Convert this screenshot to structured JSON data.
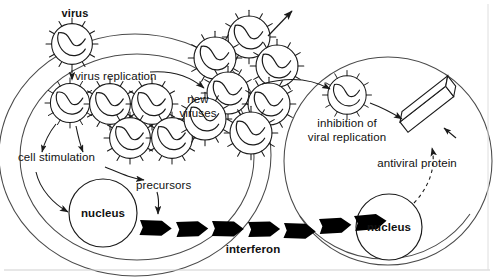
{
  "diagram": {
    "title_implied": "Interferon response to viral infection",
    "background_color": "#ffffff",
    "stroke_color": "#1a1a1a",
    "fill_color": "#000000",
    "width": 494,
    "height": 277
  },
  "labels": {
    "virus": "virus",
    "virus_replication": "virus replication",
    "new_viruses_line1": "new",
    "new_viruses_line2": "viruses",
    "cell_stimulation": "cell stimulation",
    "precursors": "precursors",
    "nucleus_left": "nucleus",
    "interferon": "interferon",
    "inhibition_line1": "inhibition of",
    "inhibition_line2": "viral replication",
    "antiviral_protein": "antiviral protein",
    "nucleus_right": "nucleus"
  },
  "elements": {
    "free_virus_top": {
      "cx": 72,
      "cy": 44,
      "r": 21
    },
    "infecting_virus": {
      "cx": 70,
      "cy": 103,
      "r": 20
    },
    "replicating_viruses": [
      {
        "cx": 109,
        "cy": 103,
        "r": 21
      },
      {
        "cx": 150,
        "cy": 103,
        "r": 21
      },
      {
        "cx": 128,
        "cy": 135,
        "r": 21
      },
      {
        "cx": 169,
        "cy": 135,
        "r": 21
      }
    ],
    "released_virus_cluster": [
      {
        "cx": 248,
        "cy": 36,
        "r": 22
      },
      {
        "cx": 214,
        "cy": 57,
        "r": 22
      },
      {
        "cx": 276,
        "cy": 65,
        "r": 22
      },
      {
        "cx": 227,
        "cy": 92,
        "r": 22
      },
      {
        "cx": 268,
        "cy": 103,
        "r": 22
      },
      {
        "cx": 204,
        "cy": 118,
        "r": 22
      },
      {
        "cx": 250,
        "cy": 132,
        "r": 22
      }
    ],
    "entering_virus_right_cell": {
      "cx": 347,
      "cy": 95,
      "r": 20
    },
    "left_cell": {
      "cx": 135,
      "cy": 155,
      "rx": 136,
      "ry": 120
    },
    "left_cell_inner_arc": {
      "cx": 135,
      "cy": 155,
      "rx": 118,
      "ry": 104
    },
    "right_cell": {
      "cx": 388,
      "cy": 160,
      "rx": 104,
      "ry": 104
    },
    "nucleus_left_shape": {
      "cx": 103,
      "cy": 213,
      "r": 34
    },
    "nucleus_right_shape": {
      "cx": 389,
      "cy": 227,
      "r": 33
    },
    "antiviral_protein_bar": {
      "x": 400,
      "y": 118,
      "angle_deg": -38
    },
    "interferon_arrow_count": 9,
    "virus_spike_count": 12
  },
  "arrows": {
    "virus_entry": "dashed, downward, virus to infected cell",
    "replication_to_release": "solid, curved, rightward to new viruses",
    "escape_upward": "solid, up-right from virus cluster",
    "cluster_to_right_cell": "solid, curved, rightward into right cell",
    "stimulation_pair": "two solid curved arrows down-left to cell stimulation",
    "stimulation_to_nucleus": "solid curved arrow down to nucleus",
    "stimulation_to_precursors": "solid curved arrow right to precursors",
    "precursors_to_interferon": "solid curved arrow down to interferon chain",
    "entering_virus_to_protein": "solid curved arrow right to antiviral protein",
    "nucleus_right_to_protein": "dashed curved arrow up to antiviral protein"
  }
}
